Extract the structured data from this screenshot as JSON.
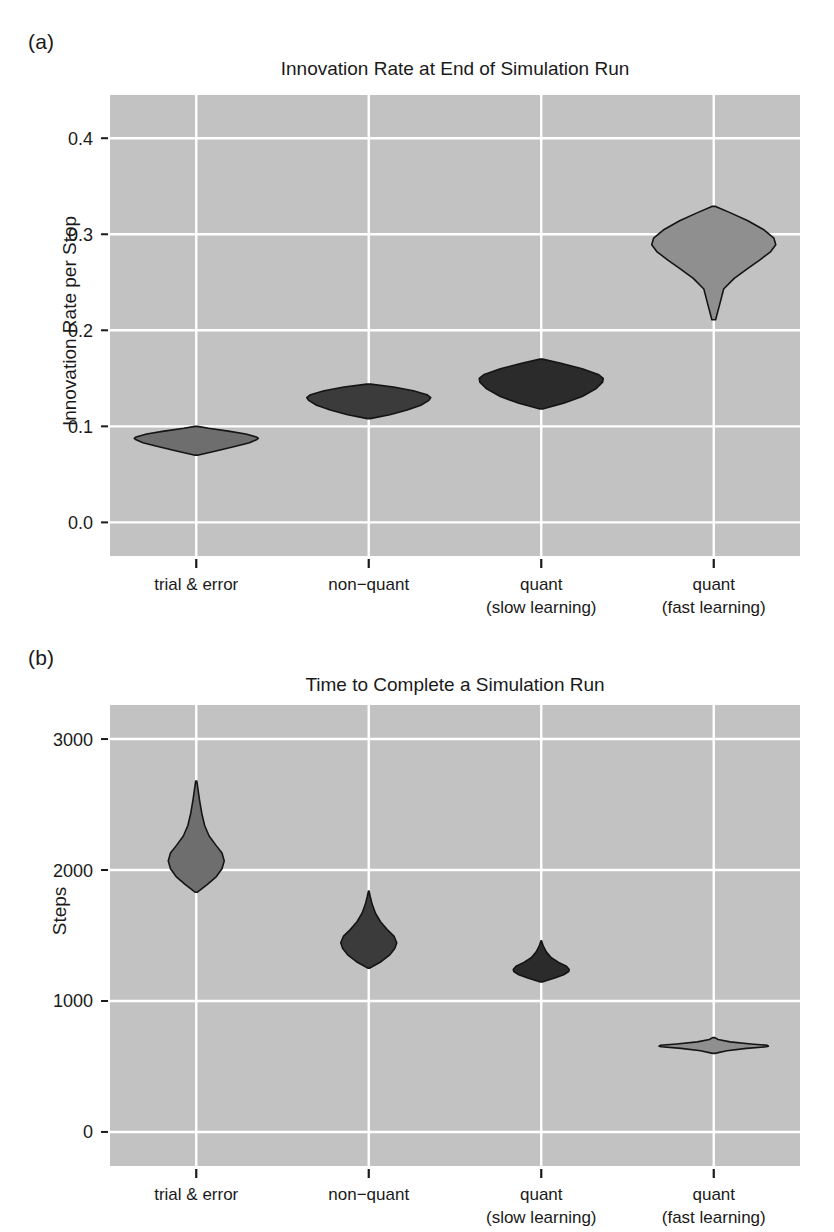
{
  "figure": {
    "background": "#ffffff",
    "panel_bg": "#c2c2c2",
    "gridline_color": "#ffffff",
    "text_color": "#1a1a1a"
  },
  "panels": [
    {
      "tag": "(a)",
      "title": "Innovation Rate at End of Simulation Run",
      "ylabel": "Innovation Rate per Stop"
    },
    {
      "tag": "(b)",
      "title": "Time to Complete a Simulation Run",
      "ylabel": "Steps"
    }
  ],
  "categories": [
    {
      "line1": "trial & error",
      "line2": ""
    },
    {
      "line1": "non−quant",
      "line2": ""
    },
    {
      "line1": "quant",
      "line2": "(slow learning)"
    },
    {
      "line1": "quant",
      "line2": "(fast learning)"
    }
  ],
  "chart_data": [
    {
      "type": "violin",
      "panel": "(a)",
      "title": "Innovation Rate at End of Simulation Run",
      "xlabel": "",
      "ylabel": "Innovation Rate per Stop",
      "categories": [
        "trial & error",
        "non−quant",
        "quant (slow learning)",
        "quant (fast learning)"
      ],
      "yticks": [
        0.0,
        0.1,
        0.2,
        0.3,
        0.4
      ],
      "ytick_labels": [
        "0.0",
        "0.1",
        "0.2",
        "0.3",
        "0.4"
      ],
      "ylim": [
        -0.035,
        0.445
      ],
      "grid": true,
      "legend": "none",
      "series": [
        {
          "name": "trial & error",
          "fill": "#6e6e6e",
          "median": 0.088,
          "min": 0.07,
          "max": 0.1,
          "profile": [
            {
              "y": 0.07,
              "w": 0.02
            },
            {
              "y": 0.074,
              "w": 0.3
            },
            {
              "y": 0.079,
              "w": 0.62
            },
            {
              "y": 0.083,
              "w": 0.86
            },
            {
              "y": 0.086,
              "w": 0.97
            },
            {
              "y": 0.0875,
              "w": 1.0
            },
            {
              "y": 0.089,
              "w": 0.97
            },
            {
              "y": 0.092,
              "w": 0.8
            },
            {
              "y": 0.095,
              "w": 0.52
            },
            {
              "y": 0.098,
              "w": 0.2
            },
            {
              "y": 0.1,
              "w": 0.02
            }
          ],
          "asym_right_tail": true
        },
        {
          "name": "non−quant",
          "fill": "#3b3b3b",
          "median": 0.13,
          "min": 0.108,
          "max": 0.144,
          "profile": [
            {
              "y": 0.108,
              "w": 0.02
            },
            {
              "y": 0.112,
              "w": 0.34
            },
            {
              "y": 0.117,
              "w": 0.62
            },
            {
              "y": 0.122,
              "w": 0.84
            },
            {
              "y": 0.127,
              "w": 0.97
            },
            {
              "y": 0.13,
              "w": 1.0
            },
            {
              "y": 0.133,
              "w": 0.94
            },
            {
              "y": 0.137,
              "w": 0.72
            },
            {
              "y": 0.141,
              "w": 0.4
            },
            {
              "y": 0.144,
              "w": 0.03
            }
          ]
        },
        {
          "name": "quant (slow learning)",
          "fill": "#2b2b2b",
          "median": 0.15,
          "min": 0.118,
          "max": 0.17,
          "profile": [
            {
              "y": 0.118,
              "w": 0.02
            },
            {
              "y": 0.124,
              "w": 0.36
            },
            {
              "y": 0.131,
              "w": 0.66
            },
            {
              "y": 0.139,
              "w": 0.88
            },
            {
              "y": 0.146,
              "w": 0.99
            },
            {
              "y": 0.15,
              "w": 1.0
            },
            {
              "y": 0.154,
              "w": 0.92
            },
            {
              "y": 0.16,
              "w": 0.66
            },
            {
              "y": 0.166,
              "w": 0.3
            },
            {
              "y": 0.17,
              "w": 0.02
            }
          ]
        },
        {
          "name": "quant (fast learning)",
          "fill": "#8f8f8f",
          "median": 0.29,
          "min": 0.211,
          "max": 0.329,
          "profile": [
            {
              "y": 0.211,
              "w": 0.03
            },
            {
              "y": 0.228,
              "w": 0.1
            },
            {
              "y": 0.243,
              "w": 0.16
            },
            {
              "y": 0.254,
              "w": 0.33
            },
            {
              "y": 0.264,
              "w": 0.54
            },
            {
              "y": 0.273,
              "w": 0.74
            },
            {
              "y": 0.282,
              "w": 0.92
            },
            {
              "y": 0.289,
              "w": 1.0
            },
            {
              "y": 0.296,
              "w": 0.97
            },
            {
              "y": 0.305,
              "w": 0.8
            },
            {
              "y": 0.314,
              "w": 0.55
            },
            {
              "y": 0.322,
              "w": 0.28
            },
            {
              "y": 0.329,
              "w": 0.03
            }
          ]
        }
      ]
    },
    {
      "type": "violin",
      "panel": "(b)",
      "title": "Time to Complete a Simulation Run",
      "xlabel": "",
      "ylabel": "Steps",
      "categories": [
        "trial & error",
        "non−quant",
        "quant (slow learning)",
        "quant (fast learning)"
      ],
      "yticks": [
        0,
        1000,
        2000,
        3000
      ],
      "ytick_labels": [
        "0",
        "1000",
        "2000",
        "3000"
      ],
      "ylim": [
        -260,
        3260
      ],
      "grid": true,
      "legend": "none",
      "series": [
        {
          "name": "trial & error",
          "fill": "#6e6e6e",
          "median": 2080,
          "min": 1830,
          "max": 2680,
          "profile": [
            {
              "y": 1830,
              "w": 0.03
            },
            {
              "y": 1890,
              "w": 0.4
            },
            {
              "y": 1950,
              "w": 0.72
            },
            {
              "y": 2010,
              "w": 0.92
            },
            {
              "y": 2070,
              "w": 1.0
            },
            {
              "y": 2130,
              "w": 0.92
            },
            {
              "y": 2190,
              "w": 0.7
            },
            {
              "y": 2260,
              "w": 0.46
            },
            {
              "y": 2340,
              "w": 0.3
            },
            {
              "y": 2430,
              "w": 0.2
            },
            {
              "y": 2530,
              "w": 0.12
            },
            {
              "y": 2620,
              "w": 0.06
            },
            {
              "y": 2680,
              "w": 0.02
            }
          ]
        },
        {
          "name": "non−quant",
          "fill": "#3b3b3b",
          "median": 1445,
          "min": 1250,
          "max": 1840,
          "profile": [
            {
              "y": 1250,
              "w": 0.02
            },
            {
              "y": 1300,
              "w": 0.44
            },
            {
              "y": 1350,
              "w": 0.74
            },
            {
              "y": 1400,
              "w": 0.93
            },
            {
              "y": 1445,
              "w": 1.0
            },
            {
              "y": 1495,
              "w": 0.9
            },
            {
              "y": 1545,
              "w": 0.66
            },
            {
              "y": 1605,
              "w": 0.42
            },
            {
              "y": 1670,
              "w": 0.24
            },
            {
              "y": 1740,
              "w": 0.12
            },
            {
              "y": 1800,
              "w": 0.05
            },
            {
              "y": 1840,
              "w": 0.01
            }
          ]
        },
        {
          "name": "quant (slow learning)",
          "fill": "#2b2b2b",
          "median": 1235,
          "min": 1145,
          "max": 1460,
          "profile": [
            {
              "y": 1145,
              "w": 0.03
            },
            {
              "y": 1175,
              "w": 0.48
            },
            {
              "y": 1200,
              "w": 0.8
            },
            {
              "y": 1225,
              "w": 0.98
            },
            {
              "y": 1240,
              "w": 1.0
            },
            {
              "y": 1265,
              "w": 0.9
            },
            {
              "y": 1295,
              "w": 0.62
            },
            {
              "y": 1330,
              "w": 0.36
            },
            {
              "y": 1375,
              "w": 0.18
            },
            {
              "y": 1420,
              "w": 0.07
            },
            {
              "y": 1460,
              "w": 0.01
            }
          ]
        },
        {
          "name": "quant (fast learning)",
          "fill": "#8f8f8f",
          "median": 660,
          "min": 600,
          "max": 720,
          "profile": [
            {
              "y": 600,
              "w": 0.02
            },
            {
              "y": 620,
              "w": 0.24
            },
            {
              "y": 638,
              "w": 0.6
            },
            {
              "y": 650,
              "w": 0.96
            },
            {
              "y": 655,
              "w": 1.0
            },
            {
              "y": 662,
              "w": 0.98
            },
            {
              "y": 672,
              "w": 0.68
            },
            {
              "y": 688,
              "w": 0.3
            },
            {
              "y": 706,
              "w": 0.08
            },
            {
              "y": 720,
              "w": 0.02
            }
          ],
          "wide_flat": true
        }
      ]
    }
  ]
}
